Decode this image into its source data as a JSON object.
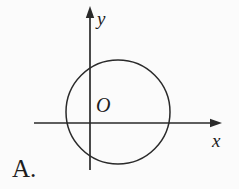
{
  "figure": {
    "background_color": "#fbfbfb",
    "line_color": "#2a2a2a",
    "text_color": "#1d1d1d",
    "y_axis": {
      "label": "y",
      "x": 90,
      "top": 16,
      "bottom": 170,
      "arrow_tip_y": 6
    },
    "x_axis": {
      "label": "x",
      "y": 123,
      "left": 34,
      "right": 212,
      "arrow_tip_x": 222
    },
    "origin": {
      "label": "O"
    },
    "circle": {
      "cx": 118,
      "cy": 112,
      "r": 52
    }
  },
  "option": {
    "label": "A."
  }
}
